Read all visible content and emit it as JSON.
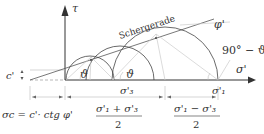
{
  "diagram": {
    "axes": {
      "tau_label": "τ",
      "sigma_label": "σ'"
    },
    "line_label": "Schergerade",
    "phi_label": "φ'",
    "angle_label_right": "90° − ϑ",
    "theta_label": "ϑ",
    "cohesion_label": "c'",
    "sigma3_label": "σ'₃",
    "sigma1_label": "σ'₁",
    "sigma_c_formula": "σc = c'· ctg φ'",
    "center_num": "σ'₁ + σ'₃",
    "center_den": "2",
    "radius_num": "σ'₁ − σ'₃",
    "radius_den": "2",
    "colors": {
      "line": "#333333",
      "light": "#bbbbbb"
    }
  }
}
